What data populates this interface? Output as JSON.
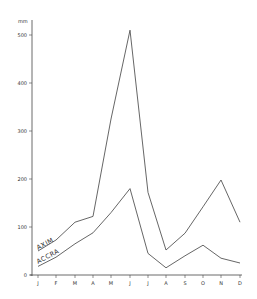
{
  "chart_data": {
    "type": "line",
    "title": "",
    "xlabel": "",
    "ylabel": "mm",
    "categories": [
      "J",
      "F",
      "M",
      "A",
      "M",
      "J",
      "J",
      "A",
      "S",
      "O",
      "N",
      "D"
    ],
    "series": [
      {
        "name": "AXIM",
        "values": [
          50,
          73,
          110,
          122,
          325,
          510,
          172,
          52,
          87,
          142,
          198,
          110
        ]
      },
      {
        "name": "ACCRA",
        "values": [
          18,
          37,
          65,
          88,
          130,
          180,
          45,
          15,
          40,
          62,
          35,
          25
        ]
      }
    ],
    "ylim": [
      0,
      520
    ],
    "yticks": [
      0,
      100,
      200,
      300,
      400,
      500
    ],
    "grid": false,
    "legend": "inline labels"
  },
  "axis": {
    "unit_label": "mm",
    "y_tick_labels": [
      "0",
      "100",
      "200",
      "300",
      "400",
      "500"
    ],
    "x_tick_labels": [
      "J",
      "F",
      "M",
      "A",
      "M",
      "J",
      "J",
      "A",
      "S",
      "O",
      "N",
      "D"
    ]
  },
  "labels": {
    "axim": "AXIM",
    "accra": "ACCRA"
  },
  "colors": {
    "line": "#555555",
    "axis": "#444444"
  }
}
